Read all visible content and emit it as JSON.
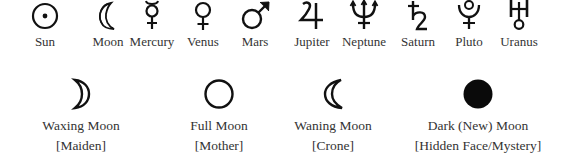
{
  "planets": [
    {
      "name": "Sun",
      "icon": "sun-icon",
      "x": 45
    },
    {
      "name": "Moon",
      "icon": "crescent-moon-icon",
      "x": 108
    },
    {
      "name": "Mercury",
      "icon": "mercury-icon",
      "x": 152
    },
    {
      "name": "Venus",
      "icon": "venus-icon",
      "x": 203
    },
    {
      "name": "Mars",
      "icon": "mars-icon",
      "x": 255
    },
    {
      "name": "Jupiter",
      "icon": "jupiter-icon",
      "x": 312
    },
    {
      "name": "Neptune",
      "icon": "neptune-icon",
      "x": 364
    },
    {
      "name": "Saturn",
      "icon": "saturn-icon",
      "x": 418
    },
    {
      "name": "Pluto",
      "icon": "pluto-icon",
      "x": 469
    },
    {
      "name": "Uranus",
      "icon": "uranus-icon",
      "x": 519
    }
  ],
  "moon_phases": [
    {
      "name": "Waxing Moon",
      "aspect": "[Maiden]",
      "icon": "waxing-moon-icon",
      "x": 81
    },
    {
      "name": "Full Moon",
      "aspect": "[Mother]",
      "icon": "full-moon-icon",
      "x": 219
    },
    {
      "name": "Waning Moon",
      "aspect": "[Crone]",
      "icon": "waning-moon-icon",
      "x": 333
    },
    {
      "name": "Dark (New) Moon",
      "aspect": "[Hidden Face/Mystery]",
      "icon": "dark-moon-icon",
      "x": 478
    }
  ],
  "colors": {
    "ink": "#111111",
    "text": "#333333",
    "background": "#ffffff"
  }
}
